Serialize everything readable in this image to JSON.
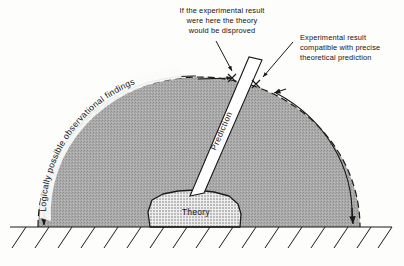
{
  "figure": {
    "background_color": "#fdfdfb",
    "ink_color": "#1a1a1a",
    "dome_fill_color": "#a9a9a9",
    "blob_fill_color": "#d8d8d8",
    "wedge_fill_color": "#ffffff"
  },
  "annotations": {
    "disproved_note": {
      "lines": [
        "If the experimental result",
        "were here the theory",
        "would be disproved"
      ]
    },
    "compatible_note": {
      "lines": [
        "Experimental result",
        "compatible with precise",
        "theoretical prediction"
      ]
    }
  },
  "arc_label": {
    "text": "Logically possible observational findings"
  },
  "wedge": {
    "label": "Prediction"
  },
  "blob": {
    "label": "Theory"
  },
  "markers": {
    "result_x_left": "×",
    "result_x_right": "×"
  }
}
